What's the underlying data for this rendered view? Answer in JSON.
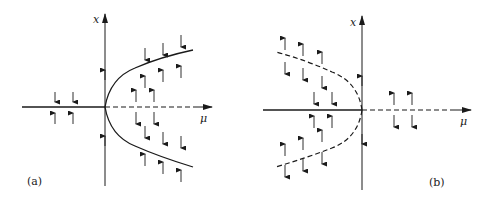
{
  "figure": {
    "panels": [
      {
        "id": "a",
        "label": "(a)",
        "description": "Supercritical pitchfork bifurcation",
        "x_axis_label": "μ",
        "y_axis_label": "x",
        "branches": [
          {
            "name": "trivial-stable",
            "region": "mu<0",
            "style": "solid"
          },
          {
            "name": "trivial-unstable",
            "region": "mu>0",
            "style": "dashed"
          },
          {
            "name": "parabola-upper-stable",
            "region": "mu>0",
            "style": "solid"
          },
          {
            "name": "parabola-lower-stable",
            "region": "mu>0",
            "style": "solid"
          }
        ]
      },
      {
        "id": "b",
        "label": "(b)",
        "description": "Subcritical pitchfork bifurcation",
        "x_axis_label": "μ",
        "y_axis_label": "x",
        "branches": [
          {
            "name": "trivial-stable",
            "region": "mu<0",
            "style": "solid"
          },
          {
            "name": "trivial-unstable",
            "region": "mu>0",
            "style": "dashed"
          },
          {
            "name": "parabola-upper-unstable",
            "region": "mu<0",
            "style": "dashed"
          },
          {
            "name": "parabola-lower-unstable",
            "region": "mu<0",
            "style": "dashed"
          }
        ]
      }
    ],
    "colors": {
      "line": "#1a1a1a",
      "background": "#ffffff"
    }
  }
}
